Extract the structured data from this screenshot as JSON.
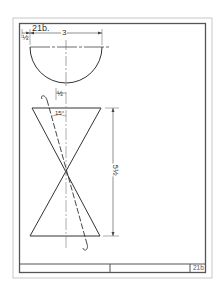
{
  "drawing": {
    "sheet_number": "21b",
    "top_view": {
      "shape": "semicircle",
      "left_offset_label": "½",
      "diameter_label": "3",
      "view_label": "21b."
    },
    "front_view": {
      "shape": "hourglass (two cones apex-to-apex)",
      "height_label": "5½",
      "top_offset_label": "½",
      "angle_label": "15°",
      "cut_line": "dashed slant line with curled ends"
    },
    "title_block": {
      "cells": [
        "",
        "",
        "21b"
      ]
    }
  },
  "colors": {
    "line": "#333333",
    "border": "#555555",
    "faint_border": "#bbbbbb",
    "background": "#ffffff"
  }
}
